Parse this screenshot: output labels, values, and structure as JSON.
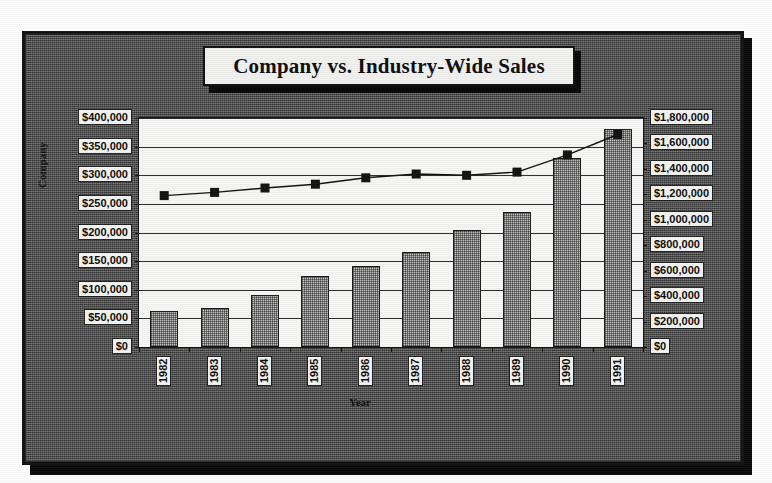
{
  "chart_data": {
    "type": "bar",
    "title": "Company vs. Industry-Wide Sales",
    "xlabel": "Year",
    "ylabel": "Company",
    "categories": [
      "1982",
      "1983",
      "1984",
      "1985",
      "1986",
      "1987",
      "1988",
      "1989",
      "1990",
      "1991"
    ],
    "series": [
      {
        "name": "Company",
        "axis": "left",
        "render": "bar",
        "values": [
          63000,
          68000,
          91000,
          124000,
          141000,
          166000,
          205000,
          236000,
          330000,
          381000
        ]
      },
      {
        "name": "Industry-Wide",
        "axis": "right",
        "render": "line",
        "marker": "square",
        "values": [
          1190000,
          1215000,
          1250000,
          1280000,
          1330000,
          1360000,
          1350000,
          1375000,
          1510000,
          1670000
        ]
      }
    ],
    "left_axis": {
      "label": "Company",
      "min": 0,
      "max": 400000,
      "step": 50000,
      "ticks": [
        "$0",
        "$50,000",
        "$100,000",
        "$150,000",
        "$200,000",
        "$250,000",
        "$300,000",
        "$350,000",
        "$400,000"
      ]
    },
    "right_axis": {
      "label": "",
      "min": 0,
      "max": 1800000,
      "step": 200000,
      "ticks": [
        "$0",
        "$200,000",
        "$400,000",
        "$600,000",
        "$800,000",
        "$1,000,000",
        "$1,200,000",
        "$1,400,000",
        "$1,600,000",
        "$1,800,000"
      ]
    },
    "grid": true,
    "legend": null,
    "colors": {
      "plot_background": "#f7f7f5",
      "chart_background": "#4a4a4a",
      "bar_fill": "#c9c9c9",
      "line": "#111111",
      "text": "#0c0c0c",
      "label_box": "#f4f4f2"
    }
  }
}
